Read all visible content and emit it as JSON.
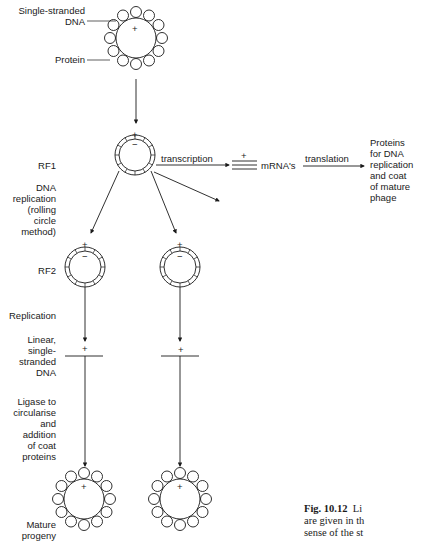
{
  "labels": {
    "ssdna": [
      "Single-stranded",
      "DNA"
    ],
    "protein": "Protein",
    "rf1": "RF1",
    "dna_replication": [
      "DNA",
      "replication",
      "(rolling",
      "circle",
      "method)"
    ],
    "rf2": "RF2",
    "replication": "Replication",
    "linear_ssdna": [
      "Linear,",
      "single-",
      "stranded",
      "DNA"
    ],
    "ligase": [
      "Ligase to",
      "circularise",
      "and",
      "addition",
      "of coat",
      "proteins"
    ],
    "mature": [
      "Mature",
      "progeny"
    ],
    "transcription": "transcription",
    "mrna": "mRNA's",
    "translation": "translation",
    "proteins_out": [
      "Proteins",
      "for DNA",
      "replication",
      "and coat",
      "of mature",
      "phage"
    ],
    "plus": "+",
    "minus": "−"
  },
  "caption": {
    "fig": "Fig. 10.12",
    "lines": [
      "Li",
      "are given in th",
      "sense of the st"
    ]
  }
}
